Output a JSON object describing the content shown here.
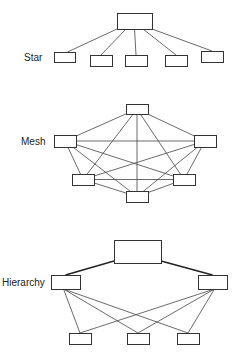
{
  "diagrams": {
    "star": {
      "label": "Star",
      "label_pos": [
        24,
        61
      ],
      "hub": {
        "x": 117,
        "y": 13,
        "w": 35,
        "h": 16
      },
      "nodes": [
        {
          "x": 54,
          "y": 52,
          "w": 21,
          "h": 10
        },
        {
          "x": 90,
          "y": 55,
          "w": 22,
          "h": 11
        },
        {
          "x": 125,
          "y": 55,
          "w": 22,
          "h": 11
        },
        {
          "x": 165,
          "y": 55,
          "w": 22,
          "h": 11
        },
        {
          "x": 201,
          "y": 51,
          "w": 22,
          "h": 11
        }
      ]
    },
    "mesh": {
      "label": "Mesh",
      "label_pos": [
        21,
        145
      ],
      "nodes": [
        {
          "x": 126,
          "y": 104,
          "w": 22,
          "h": 10
        },
        {
          "x": 54,
          "y": 135,
          "w": 22,
          "h": 12
        },
        {
          "x": 194,
          "y": 135,
          "w": 22,
          "h": 12
        },
        {
          "x": 72,
          "y": 174,
          "w": 22,
          "h": 11
        },
        {
          "x": 173,
          "y": 174,
          "w": 22,
          "h": 11
        },
        {
          "x": 126,
          "y": 191,
          "w": 22,
          "h": 11
        }
      ]
    },
    "hierarchy": {
      "label": "Hierarchy",
      "label_pos": [
        2,
        286
      ],
      "root": {
        "x": 114,
        "y": 240,
        "w": 47,
        "h": 23
      },
      "mid": [
        {
          "x": 51,
          "y": 275,
          "w": 29,
          "h": 14
        },
        {
          "x": 198,
          "y": 275,
          "w": 29,
          "h": 14
        }
      ],
      "leaves": [
        {
          "x": 69,
          "y": 333,
          "w": 22,
          "h": 11
        },
        {
          "x": 127,
          "y": 333,
          "w": 22,
          "h": 11
        },
        {
          "x": 177,
          "y": 333,
          "w": 22,
          "h": 11
        }
      ]
    }
  },
  "colors": {
    "stroke": "#333333",
    "background": "#ffffff"
  }
}
